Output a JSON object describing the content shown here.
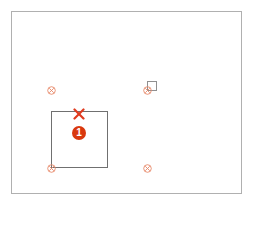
{
  "diagram": {
    "frame": {
      "border_color": "#b0b0b0"
    },
    "target_square": {
      "border_color": "#707070"
    },
    "markers": [
      {
        "id": "marker-top-left",
        "x": 51,
        "y": 90,
        "color": "#e8896a"
      },
      {
        "id": "marker-top-right",
        "x": 147,
        "y": 90,
        "color": "#e8896a"
      },
      {
        "id": "marker-bottom-left",
        "x": 51,
        "y": 168,
        "color": "#e8896a"
      },
      {
        "id": "marker-bottom-right",
        "x": 147,
        "y": 168,
        "color": "#e8896a"
      }
    ],
    "x_mark": {
      "color": "#e03a1e"
    },
    "badge": {
      "label": "1",
      "color": "#d9380e"
    }
  }
}
